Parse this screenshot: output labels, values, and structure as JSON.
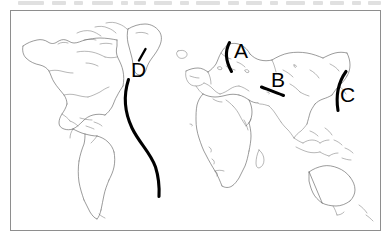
{
  "figure": {
    "type": "world-map-outline",
    "frame": {
      "x": 10,
      "y": 10,
      "width": 371,
      "height": 221,
      "border_color": "#8e8e8e"
    },
    "background_color": "#ffffff",
    "coastline_color": "#5d5d5d",
    "marker_color": "#000000"
  },
  "markers": [
    {
      "id": "A",
      "label": "A",
      "label_x": 234,
      "label_y": 40,
      "shape": "arc",
      "region": "Scandinavia / Norwegian coast",
      "stroke_path": "M229.5,42.5 C225.5,50 225.0,60 231.5,71.5"
    },
    {
      "id": "B",
      "label": "B",
      "label_x": 271,
      "label_y": 69,
      "shape": "line",
      "region": "Central Asia / Himalaya belt",
      "stroke_path": "M261.5,87.0 C268,89.5 276,92.5 283.5,95.5"
    },
    {
      "id": "C",
      "label": "C",
      "label_x": 340,
      "label_y": 84,
      "shape": "arc",
      "region": "East Asian coast / Pacific margin",
      "stroke_path": "M346.0,71.5 C338.5,82 335.5,95 338.0,110.5"
    },
    {
      "id": "D",
      "label": "D",
      "label_x": 131,
      "label_y": 59,
      "shape": "long-s-curve",
      "region": "Atlantic Ocean, mid-ocean ridge line",
      "stroke_path": "M128.5,79.5 C123.5,95 124.5,112 132.0,128.0 C139.5,143.5 150.5,152.5 155.5,167.0 C158.5,176.5 159.5,187 159.0,196.5",
      "tick_path": "M145.5,49.0 L139.0,60.5"
    }
  ],
  "scan_artifact": {
    "visible": true,
    "segments": [
      {
        "x": 18,
        "width": 26
      },
      {
        "x": 52,
        "width": 14
      },
      {
        "x": 74,
        "width": 9
      },
      {
        "x": 92,
        "width": 21
      },
      {
        "x": 121,
        "width": 7
      },
      {
        "x": 134,
        "width": 12
      },
      {
        "x": 154,
        "width": 18
      },
      {
        "x": 180,
        "width": 9
      },
      {
        "x": 196,
        "width": 24
      },
      {
        "x": 228,
        "width": 11
      },
      {
        "x": 246,
        "width": 16
      },
      {
        "x": 270,
        "width": 8
      },
      {
        "x": 286,
        "width": 19
      },
      {
        "x": 313,
        "width": 10
      },
      {
        "x": 330,
        "width": 14
      },
      {
        "x": 352,
        "width": 9
      },
      {
        "x": 368,
        "width": 13
      }
    ]
  }
}
